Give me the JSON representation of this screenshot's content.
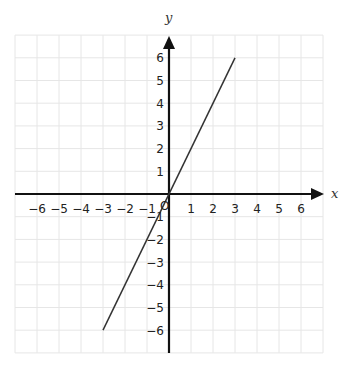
{
  "chart_data": {
    "type": "line",
    "title": "",
    "xlabel": "x",
    "ylabel": "y",
    "origin_label": "O",
    "xlim": [
      -7,
      7
    ],
    "ylim": [
      -7,
      7
    ],
    "grid": true,
    "x_ticks": [
      -6,
      -5,
      -4,
      -3,
      -2,
      -1,
      1,
      2,
      3,
      4,
      5,
      6
    ],
    "y_ticks": [
      -6,
      -5,
      -4,
      -3,
      -2,
      -1,
      1,
      2,
      3,
      4,
      5,
      6
    ],
    "x_tick_labels": [
      "−6",
      "−5",
      "−4",
      "−3",
      "−2",
      "−1",
      "1",
      "2",
      "3",
      "4",
      "5",
      "6"
    ],
    "y_tick_labels": [
      "−6",
      "−5",
      "−4",
      "−3",
      "−2",
      "−1",
      "1",
      "2",
      "3",
      "4",
      "5",
      "6"
    ],
    "series": [
      {
        "name": "y = 2x",
        "x": [
          -3,
          3
        ],
        "y": [
          -6,
          6
        ],
        "color": "#333333"
      }
    ],
    "axis_color": "#111111",
    "grid_color": "#e6e6e6"
  }
}
